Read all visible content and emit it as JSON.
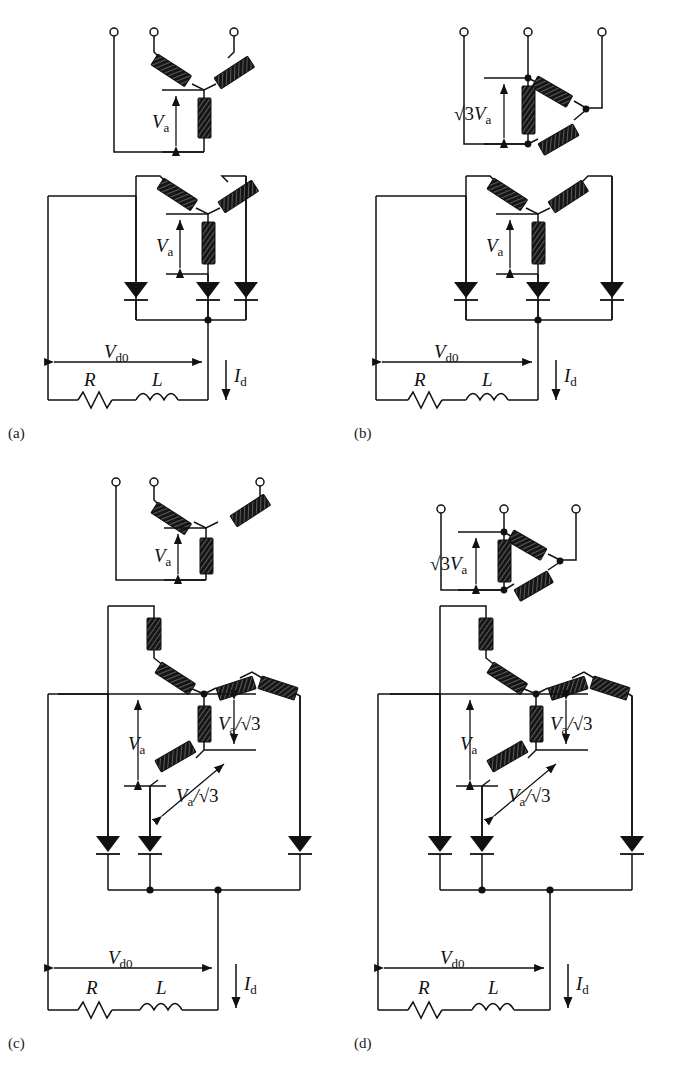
{
  "figure": {
    "background": "#ffffff",
    "ink": "#111111",
    "winding_fill": "#1a1a1a",
    "panel_count": 4
  },
  "symbols": {
    "terminal": "open-circle-terminal",
    "winding": "transformer-winding-coil",
    "diode": "diode-triangle-down",
    "resistor": "resistor-zigzag",
    "inductor": "inductor-coil",
    "node": "junction-dot",
    "arrow_double": "dimension-arrow-double",
    "arrow_single": "current-arrow-down"
  },
  "labels": {
    "Va": "V",
    "Va_sub": "a",
    "Vd0": "V",
    "Vd0_sub": "d0",
    "Id": "I",
    "Id_sub": "d",
    "R": "R",
    "L": "L",
    "sqrt3": "√3",
    "slash": "/",
    "sqrt3_Va": "√3V",
    "Va_over_sqrt3": "V",
    "a_over": "a"
  },
  "panels": [
    {
      "id": "a",
      "caption": "(a)",
      "primary": {
        "type": "wye",
        "name": "wye-primary",
        "voltage_label": "Va"
      },
      "secondary": {
        "type": "wye",
        "name": "wye-secondary",
        "voltage_label": "Va"
      },
      "rectifier": {
        "type": "three-pulse",
        "diode_count": 3
      },
      "load": {
        "resistor": "R",
        "inductor": "L",
        "voltage": "Vd0",
        "current": "Id"
      }
    },
    {
      "id": "b",
      "caption": "(b)",
      "primary": {
        "type": "delta",
        "name": "delta-primary",
        "voltage_label": "sqrt3_Va"
      },
      "secondary": {
        "type": "wye",
        "name": "wye-secondary",
        "voltage_label": "Va"
      },
      "rectifier": {
        "type": "three-pulse",
        "diode_count": 3
      },
      "load": {
        "resistor": "R",
        "inductor": "L",
        "voltage": "Vd0",
        "current": "Id"
      }
    },
    {
      "id": "c",
      "caption": "(c)",
      "primary": {
        "type": "wye",
        "name": "wye-primary",
        "voltage_label": "Va"
      },
      "secondary": {
        "type": "zigzag",
        "name": "zigzag-secondary",
        "voltage_label": "Va",
        "segment_labels": [
          "Va_over_sqrt3",
          "Va_over_sqrt3"
        ]
      },
      "rectifier": {
        "type": "three-pulse",
        "diode_count": 3
      },
      "load": {
        "resistor": "R",
        "inductor": "L",
        "voltage": "Vd0",
        "current": "Id"
      }
    },
    {
      "id": "d",
      "caption": "(d)",
      "primary": {
        "type": "delta",
        "name": "delta-primary",
        "voltage_label": "sqrt3_Va"
      },
      "secondary": {
        "type": "zigzag",
        "name": "zigzag-secondary",
        "voltage_label": "Va",
        "segment_labels": [
          "Va_over_sqrt3",
          "Va_over_sqrt3"
        ]
      },
      "rectifier": {
        "type": "three-pulse",
        "diode_count": 3
      },
      "load": {
        "resistor": "R",
        "inductor": "L",
        "voltage": "Vd0",
        "current": "Id"
      }
    }
  ],
  "captions": {
    "a": "(a)",
    "b": "(b)",
    "c": "(c)",
    "d": "(d)"
  }
}
